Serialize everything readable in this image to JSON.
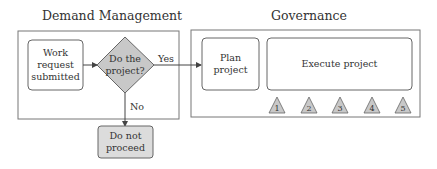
{
  "sections": {
    "demand": {
      "title": "Demand Management"
    },
    "governance": {
      "title": "Governance"
    }
  },
  "nodes": {
    "work_request": {
      "lines": [
        "Work",
        "request",
        "submitted"
      ]
    },
    "decision": {
      "lines": [
        "Do the",
        "project?"
      ]
    },
    "do_not_proceed": {
      "lines": [
        "Do not",
        "proceed"
      ]
    },
    "plan_project": {
      "lines": [
        "Plan",
        "project"
      ]
    },
    "execute_project": {
      "lines": [
        "Execute project"
      ]
    }
  },
  "edges": {
    "yes_label": "Yes",
    "no_label": "No"
  },
  "milestones": [
    "1",
    "2",
    "3",
    "4",
    "5"
  ],
  "colors": {
    "decision_fill": "#c8c8c8",
    "terminal_fill": "#dcdcdc",
    "stroke": "#555555"
  }
}
